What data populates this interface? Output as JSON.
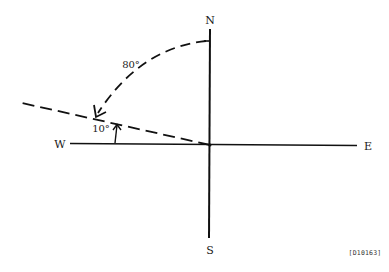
{
  "diagram": {
    "type": "compass-bearing",
    "labels": {
      "north": "N",
      "south": "S",
      "west": "W",
      "east": "E"
    },
    "angles": {
      "arc_from_north": "80°",
      "above_west": "10°"
    },
    "figure_id": "[D10163]",
    "colors": {
      "line": "#111111",
      "background": "#ffffff"
    }
  }
}
